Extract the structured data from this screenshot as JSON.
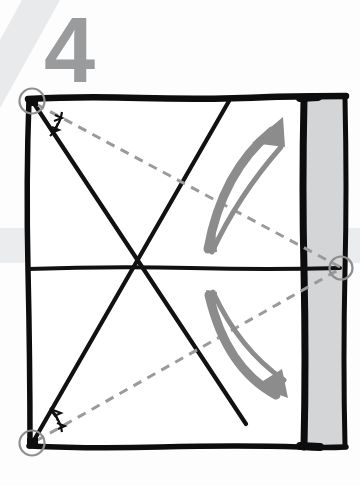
{
  "figure": {
    "kind": "origami-instruction-diagram",
    "step_number": "4",
    "background_color": "#fdfdfd",
    "bands": [
      {
        "name": "diagonal-corner-band",
        "color": "#e6e7e8",
        "position": "top-left-diagonal"
      },
      {
        "name": "horizontal-band",
        "color": "#ebecee",
        "top": 228,
        "bottom": 263
      }
    ],
    "paper": {
      "name": "square-sheet",
      "outline_color": "#0d0d0d",
      "fill_color": "#ffffff",
      "left": 27,
      "top": 97,
      "right": 305,
      "bottom": 448
    },
    "flap": {
      "name": "right-flap-panel",
      "fill_color": "#d4d5d7",
      "outline_color": "#0d0d0d",
      "left": 305,
      "right": 345,
      "top": 97,
      "bottom": 448
    },
    "crease_lines": {
      "solid_color": "#111111",
      "dashed_color": "#9a9a9a",
      "solid": [
        {
          "name": "crease-top-left-to-lower-right",
          "from": [
            32,
            101
          ],
          "to": [
            246,
            425
          ]
        },
        {
          "name": "crease-bottom-left-to-upper-right",
          "from": [
            32,
            443
          ],
          "to": [
            229,
            100
          ]
        },
        {
          "name": "crease-horizontal-midline",
          "from": [
            27,
            268
          ],
          "to": [
            340,
            268
          ]
        }
      ],
      "dashed": [
        {
          "name": "reference-line-top-left-to-right-mid",
          "from": [
            34,
            103
          ],
          "to": [
            341,
            268
          ]
        },
        {
          "name": "reference-line-bottom-left-to-right-mid",
          "from": [
            34,
            442
          ],
          "to": [
            341,
            268
          ]
        }
      ]
    },
    "markers": [
      {
        "name": "corner-marker-top-left",
        "cx": 32,
        "cy": 101,
        "r": 13,
        "stroke": "#8f8f8f",
        "dot": true
      },
      {
        "name": "corner-marker-bottom-left",
        "cx": 32,
        "cy": 443,
        "r": 13,
        "stroke": "#8f8f8f",
        "dot": true
      },
      {
        "name": "edge-marker-right-middle",
        "cx": 341,
        "cy": 268,
        "r": 12,
        "stroke": "#8f8f8f",
        "dot": false
      }
    ],
    "angle_marks": [
      {
        "name": "equal-angle-arcs-top-left",
        "corner": [
          32,
          101
        ],
        "count": 2
      },
      {
        "name": "equal-angle-arcs-bottom-left",
        "corner": [
          32,
          443
        ],
        "count": 2
      }
    ],
    "arrows": [
      {
        "name": "fold-arrow-upper",
        "color": "#8c8c8c",
        "direction": "up-right",
        "description": "curved arrow sweeping up toward the right flap"
      },
      {
        "name": "fold-arrow-lower",
        "color": "#8c8c8c",
        "direction": "down-right",
        "description": "curved arrow sweeping down toward the right flap"
      }
    ],
    "colors": {
      "step_number": "#9a9b9d",
      "ink": "#0d0d0d",
      "dashed": "#9a9a9a",
      "arrow": "#8c8c8c",
      "flap": "#d4d5d7",
      "marker": "#8f8f8f"
    }
  }
}
